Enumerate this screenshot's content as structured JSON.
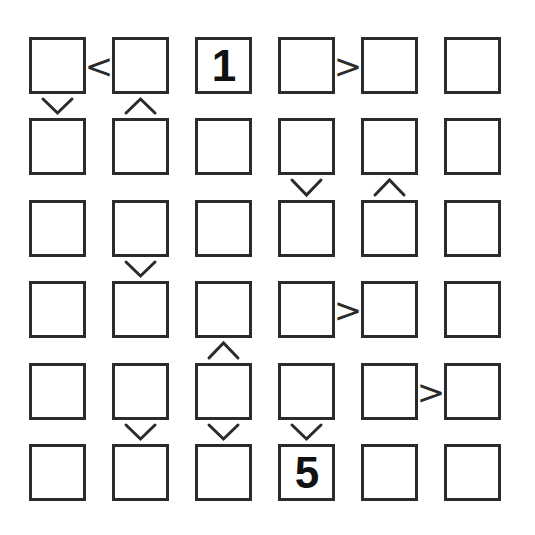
{
  "puzzle": {
    "type": "futoshiki",
    "grid_size": 6,
    "rows": 6,
    "cols": 6,
    "line_color": "#2b2b2b",
    "background_color": "#ffffff",
    "digit_color": "#111111",
    "cells": [
      [
        {
          "row": 1,
          "col": 1,
          "value": ""
        },
        {
          "row": 1,
          "col": 2,
          "value": ""
        },
        {
          "row": 1,
          "col": 3,
          "value": "1"
        },
        {
          "row": 1,
          "col": 4,
          "value": ""
        },
        {
          "row": 1,
          "col": 5,
          "value": ""
        },
        {
          "row": 1,
          "col": 6,
          "value": ""
        }
      ],
      [
        {
          "row": 2,
          "col": 1,
          "value": ""
        },
        {
          "row": 2,
          "col": 2,
          "value": ""
        },
        {
          "row": 2,
          "col": 3,
          "value": ""
        },
        {
          "row": 2,
          "col": 4,
          "value": ""
        },
        {
          "row": 2,
          "col": 5,
          "value": ""
        },
        {
          "row": 2,
          "col": 6,
          "value": ""
        }
      ],
      [
        {
          "row": 3,
          "col": 1,
          "value": ""
        },
        {
          "row": 3,
          "col": 2,
          "value": ""
        },
        {
          "row": 3,
          "col": 3,
          "value": ""
        },
        {
          "row": 3,
          "col": 4,
          "value": ""
        },
        {
          "row": 3,
          "col": 5,
          "value": ""
        },
        {
          "row": 3,
          "col": 6,
          "value": ""
        }
      ],
      [
        {
          "row": 4,
          "col": 1,
          "value": ""
        },
        {
          "row": 4,
          "col": 2,
          "value": ""
        },
        {
          "row": 4,
          "col": 3,
          "value": ""
        },
        {
          "row": 4,
          "col": 4,
          "value": ""
        },
        {
          "row": 4,
          "col": 5,
          "value": ""
        },
        {
          "row": 4,
          "col": 6,
          "value": ""
        }
      ],
      [
        {
          "row": 5,
          "col": 1,
          "value": ""
        },
        {
          "row": 5,
          "col": 2,
          "value": ""
        },
        {
          "row": 5,
          "col": 3,
          "value": ""
        },
        {
          "row": 5,
          "col": 4,
          "value": ""
        },
        {
          "row": 5,
          "col": 5,
          "value": ""
        },
        {
          "row": 5,
          "col": 6,
          "value": ""
        }
      ],
      [
        {
          "row": 6,
          "col": 1,
          "value": ""
        },
        {
          "row": 6,
          "col": 2,
          "value": ""
        },
        {
          "row": 6,
          "col": 3,
          "value": ""
        },
        {
          "row": 6,
          "col": 4,
          "value": "5"
        },
        {
          "row": 6,
          "col": 5,
          "value": ""
        },
        {
          "row": 6,
          "col": 6,
          "value": ""
        }
      ]
    ],
    "givens": [
      {
        "row": 1,
        "col": 3,
        "value": "1"
      },
      {
        "row": 6,
        "col": 4,
        "value": "5"
      }
    ],
    "horizontal_constraints": [
      {
        "row": 1,
        "left_col": 1,
        "right_col": 2,
        "symbol": "<",
        "name": "less-than"
      },
      {
        "row": 1,
        "left_col": 4,
        "right_col": 5,
        "symbol": ">",
        "name": "greater-than"
      },
      {
        "row": 4,
        "left_col": 4,
        "right_col": 5,
        "symbol": ">",
        "name": "greater-than"
      },
      {
        "row": 5,
        "left_col": 5,
        "right_col": 6,
        "symbol": ">",
        "name": "greater-than"
      }
    ],
    "vertical_constraints": [
      {
        "col": 1,
        "top_row": 1,
        "bottom_row": 2,
        "symbol": "v",
        "name": "chevron-down"
      },
      {
        "col": 2,
        "top_row": 1,
        "bottom_row": 2,
        "symbol": "^",
        "name": "chevron-up"
      },
      {
        "col": 4,
        "top_row": 2,
        "bottom_row": 3,
        "symbol": "v",
        "name": "chevron-down"
      },
      {
        "col": 5,
        "top_row": 2,
        "bottom_row": 3,
        "symbol": "^",
        "name": "chevron-up"
      },
      {
        "col": 2,
        "top_row": 3,
        "bottom_row": 4,
        "symbol": "v",
        "name": "chevron-down"
      },
      {
        "col": 3,
        "top_row": 4,
        "bottom_row": 5,
        "symbol": "^",
        "name": "chevron-up"
      },
      {
        "col": 2,
        "top_row": 5,
        "bottom_row": 6,
        "symbol": "v",
        "name": "chevron-down"
      },
      {
        "col": 3,
        "top_row": 5,
        "bottom_row": 6,
        "symbol": "v",
        "name": "chevron-down"
      },
      {
        "col": 4,
        "top_row": 5,
        "bottom_row": 6,
        "symbol": "v",
        "name": "chevron-down"
      }
    ],
    "geometry": {
      "col_lefts": [
        29,
        112,
        195,
        278,
        361,
        444
      ],
      "row_tops": [
        37,
        118,
        200,
        281,
        363,
        444
      ],
      "cell_size": 57
    }
  }
}
